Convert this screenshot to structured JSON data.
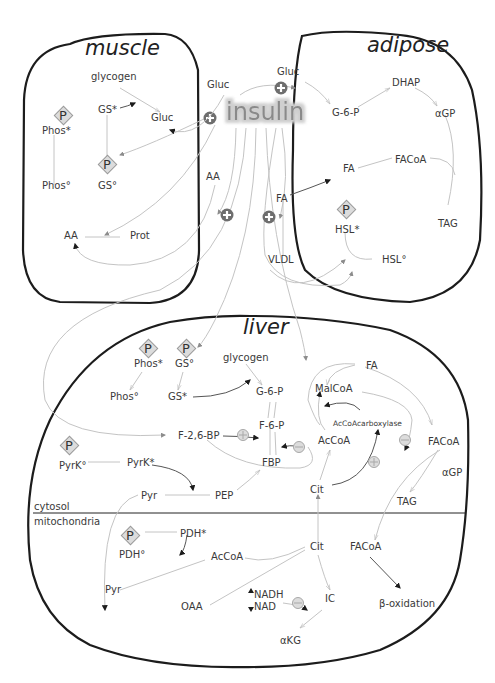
{
  "organs": {
    "muscle": "muscle",
    "adipose": "adipose",
    "liver": "liver"
  },
  "hormone": "insulin",
  "compartments": {
    "cytosol": "cytosol",
    "mitochondria": "mitochondria"
  },
  "outside": {
    "gluc_left": "Gluc",
    "gluc_right": "Gluc",
    "aa": "AA",
    "fa": "FA",
    "vldl": "VLDL"
  },
  "muscle": {
    "glycogen": "glycogen",
    "gs_active": "GS*",
    "gluc": "Gluc",
    "phos_active": "Phos*",
    "phos_inactive": "Phos°",
    "gs_inactive": "GS°",
    "aa": "AA",
    "prot": "Prot"
  },
  "adipose": {
    "g6p": "G-6-P",
    "dhap": "DHAP",
    "agp": "αGP",
    "fa": "FA",
    "facoa": "FACoA",
    "tag": "TAG",
    "hsl_active": "HSL*",
    "hsl_inactive": "HSL°"
  },
  "liver": {
    "phos_active": "Phos*",
    "gs_inactive": "GS°",
    "glycogen": "glycogen",
    "phos_inactive": "Phos°",
    "gs_active": "GS*",
    "g6p": "G-6-P",
    "f6p": "F-6-P",
    "f26bp": "F-2,6-BP",
    "fbp": "FBP",
    "pyrk_inactive": "PyrK°",
    "pyrk_active": "PyrK*",
    "pyr_cyt": "Pyr",
    "pep": "PEP",
    "fa": "FA",
    "malcoa": "MalCoA",
    "accoa_carboxylase": "AcCoAcarboxylase",
    "accoa_cyt": "AcCoA",
    "facoa_cyt": "FACoA",
    "agp": "αGP",
    "tag": "TAG",
    "cit_cyt": "Cit",
    "pdh_active": "PDH*",
    "pdh_inactive": "PDH°",
    "accoa_mito": "AcCoA",
    "pyr_mito": "Pyr",
    "oaa": "OAA",
    "cit_mito": "Cit",
    "facoa_mito": "FACoA",
    "nadh": "NADH",
    "nad": "NAD",
    "ic": "IC",
    "akg": "αKG",
    "beta_oxidation": "β-oxidation"
  },
  "symbols": {
    "phosphate": "P"
  }
}
